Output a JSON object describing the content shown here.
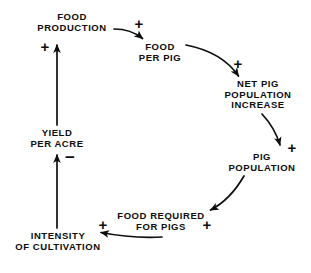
{
  "diagram": {
    "type": "causal-loop-diagram",
    "background_color": "#ffffff",
    "ink_color": "#0d0d0d",
    "nodes": [
      {
        "id": "food-production",
        "label": "FOOD\nPRODUCTION",
        "x": 72,
        "y": 12
      },
      {
        "id": "food-per-pig",
        "label": "FOOD\nPER PIG",
        "x": 160,
        "y": 42
      },
      {
        "id": "net-pig-population-increase",
        "label": "NET PIG\nPOPULATION\nINCREASE",
        "x": 258,
        "y": 79
      },
      {
        "id": "pig-population",
        "label": "PIG\nPOPULATION",
        "x": 262,
        "y": 152
      },
      {
        "id": "food-required-for-pigs",
        "label": "FOOD REQUIRED\nFOR PIGS",
        "x": 161,
        "y": 211
      },
      {
        "id": "intensity-of-cultivation",
        "label": "INTENSITY\nOF CULTIVATION",
        "x": 58,
        "y": 231
      },
      {
        "id": "yield-per-acre",
        "label": "YIELD\nPER ACRE",
        "x": 57,
        "y": 128
      }
    ],
    "links": [
      {
        "id": "food-production-to-food-per-pig",
        "from": "food-production",
        "to": "food-per-pig",
        "polarity": "+",
        "sign_x": 139,
        "sign_y": 23
      },
      {
        "id": "food-per-pig-to-net-pig-population-increase",
        "from": "food-per-pig",
        "to": "net-pig-population-increase",
        "polarity": "+",
        "sign_x": 238,
        "sign_y": 63
      },
      {
        "id": "net-pig-population-increase-to-pig-population",
        "from": "net-pig-population-increase",
        "to": "pig-population",
        "polarity": "+",
        "sign_x": 292,
        "sign_y": 147
      },
      {
        "id": "pig-population-to-food-required-for-pigs",
        "from": "pig-population",
        "to": "food-required-for-pigs",
        "polarity": "+",
        "sign_x": 207,
        "sign_y": 224
      },
      {
        "id": "food-required-for-pigs-to-intensity-of-cultivation",
        "from": "food-required-for-pigs",
        "to": "intensity-of-cultivation",
        "polarity": "+",
        "sign_x": 103,
        "sign_y": 224
      },
      {
        "id": "intensity-of-cultivation-to-yield-per-acre",
        "from": "intensity-of-cultivation",
        "to": "yield-per-acre",
        "polarity": "−",
        "sign_x": 70,
        "sign_y": 157
      },
      {
        "id": "yield-per-acre-to-food-production",
        "from": "yield-per-acre",
        "to": "food-production",
        "polarity": "+",
        "sign_x": 45,
        "sign_y": 46
      }
    ]
  }
}
